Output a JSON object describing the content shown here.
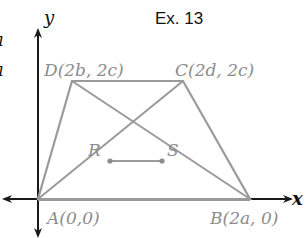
{
  "title": "Ex. 13",
  "cropped_left_text": [
    "a",
    "a"
  ],
  "axes": {
    "x_label": "x",
    "y_label": "y"
  },
  "colors": {
    "figure": "#9a9a9a",
    "axis": "#1a1a1a",
    "label": "#8c8c8c",
    "text": "#111111"
  },
  "points": {
    "A": {
      "label": "A(0,0)"
    },
    "B": {
      "label": "B(2a,  0)"
    },
    "C": {
      "label": "C(2d,  2c)"
    },
    "D": {
      "label": "D(2b,  2c)"
    },
    "R": {
      "label": "R"
    },
    "S": {
      "label": "S"
    }
  }
}
